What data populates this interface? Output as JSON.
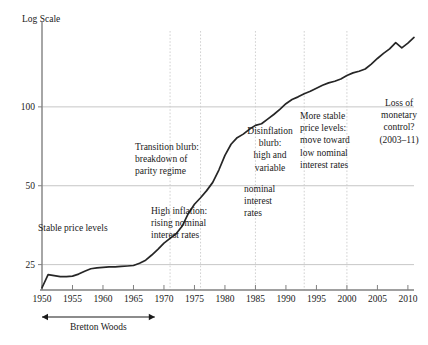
{
  "chart_data": {
    "type": "line",
    "title": "",
    "subtitle": "",
    "xlabel": "",
    "ylabel": "Log Scale",
    "yscale": "log",
    "ylim": [
      20,
      200
    ],
    "xlim": [
      1950,
      2011
    ],
    "grid": "both",
    "legend_position": "none",
    "yticks": [
      25,
      50,
      100
    ],
    "ytick_labels": [
      "25",
      "50",
      "100"
    ],
    "xticks": [
      1950,
      1955,
      1960,
      1965,
      1970,
      1975,
      1980,
      1985,
      1990,
      1995,
      2000,
      2005,
      2010
    ],
    "xtick_labels": [
      "1950",
      "1955",
      "1960",
      "1965",
      "1970",
      "1975",
      "1980",
      "1985",
      "1990",
      "1995",
      "2000",
      "2005",
      "2010"
    ],
    "series": [
      {
        "name": "Price level (index, log scale)",
        "x": [
          1950,
          1951,
          1952,
          1953,
          1954,
          1955,
          1956,
          1957,
          1958,
          1959,
          1960,
          1961,
          1962,
          1963,
          1964,
          1965,
          1966,
          1967,
          1968,
          1969,
          1970,
          1971,
          1972,
          1973,
          1974,
          1975,
          1976,
          1977,
          1978,
          1979,
          1980,
          1981,
          1982,
          1983,
          1984,
          1985,
          1986,
          1987,
          1988,
          1989,
          1990,
          1991,
          1992,
          1993,
          1994,
          1995,
          1996,
          1997,
          1998,
          1999,
          2000,
          2001,
          2002,
          2003,
          2004,
          2005,
          2006,
          2007,
          2008,
          2009,
          2010,
          2011
        ],
        "values": [
          20.4,
          22.9,
          22.7,
          22.5,
          22.5,
          22.6,
          23.0,
          23.6,
          24.1,
          24.3,
          24.4,
          24.5,
          24.5,
          24.6,
          24.7,
          24.8,
          25.3,
          26.0,
          27.2,
          28.6,
          30.2,
          31.5,
          32.8,
          35.1,
          39.2,
          42.5,
          45.0,
          47.9,
          51.5,
          57.4,
          65.3,
          72.0,
          76.3,
          78.7,
          82.1,
          85.0,
          86.2,
          89.8,
          93.5,
          97.8,
          102.8,
          106.7,
          109.2,
          112.3,
          114.7,
          117.7,
          120.9,
          123.5,
          125.3,
          127.8,
          131.8,
          134.8,
          136.7,
          139.5,
          145.7,
          153.0,
          160.0,
          166.5,
          176.0,
          168.0,
          175.0,
          184.0
        ]
      }
    ],
    "annotations": [
      {
        "id": "stable-price-levels",
        "text": "Stable price levels",
        "x_left": 38,
        "y_top": 222,
        "width": 110,
        "align": "left"
      },
      {
        "id": "transition-blurb",
        "text": "Transition blurb:\nbreakdown of\nparity regime",
        "x_left": 135,
        "y_top": 141,
        "width": 96,
        "align": "left"
      },
      {
        "id": "high-inflation",
        "text": "High inflation:\nrising nominal\ninterest rates",
        "x_left": 151,
        "y_top": 205,
        "width": 92,
        "align": "left"
      },
      {
        "id": "disinflation-blurb",
        "text": "Disinflation\nblurb:\nhigh and\nvariable",
        "x_left": 244,
        "y_top": 125,
        "width": 52,
        "align": "center"
      },
      {
        "id": "disinflation-blurb-cont",
        "text": "nominal\ninterest\nrates",
        "x_left": 244,
        "y_top": 183,
        "width": 52,
        "align": "left"
      },
      {
        "id": "more-stable-price-levels",
        "text": "More stable\nprice levels:\nmove toward\nlow nominal\ninterest rates",
        "x_left": 300,
        "y_top": 110,
        "width": 72,
        "align": "left"
      },
      {
        "id": "loss-of-monetary-control",
        "text": "Loss of\nmonetary\ncontrol?\n(2003–11)",
        "x_left": 372,
        "y_top": 97,
        "width": 54,
        "align": "center"
      }
    ],
    "vertical_markers": [
      {
        "id": "marker-1971",
        "x": 1971
      },
      {
        "id": "marker-1976",
        "x": 1976
      },
      {
        "id": "marker-1985",
        "x": 1985
      },
      {
        "id": "marker-1993",
        "x": 1993
      },
      {
        "id": "marker-2000",
        "x": 2000
      }
    ],
    "span_annotations": [
      {
        "id": "bretton-woods",
        "label": "Bretton Woods",
        "x_start": 1950,
        "x_end": 1968.5
      }
    ]
  },
  "axis": {
    "y_axis_caption": "Log Scale"
  },
  "colors": {
    "line": "#262626",
    "axis": "#808080",
    "grid": "#bfbfbf",
    "grid_dotted": "#cccccc",
    "text": "#1a1a1a",
    "background": "#ffffff"
  }
}
